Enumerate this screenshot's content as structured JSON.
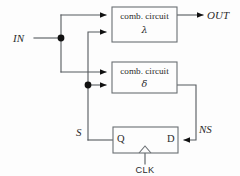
{
  "diagram": {
    "background_color": "#fdfdfd",
    "wire_color": "#555a5e",
    "box_stroke_color": "#6a6f73",
    "text_color": "#2b2b2b",
    "junction_color": "#111111"
  },
  "blocks": [
    {
      "id": "lambda-block",
      "line1": "comb. circuit",
      "line2": "λ",
      "x": 112,
      "y": 7,
      "w": 65,
      "h": 35
    },
    {
      "id": "delta-block",
      "line1": "comb. circuit",
      "line2": "δ",
      "x": 112,
      "y": 62,
      "w": 65,
      "h": 31
    },
    {
      "id": "flipflop-block",
      "pin_left": "Q",
      "pin_right": "D",
      "x": 113,
      "y": 127,
      "w": 65,
      "h": 26
    }
  ],
  "signals": {
    "input": "IN",
    "output": "OUT",
    "state": "S",
    "next_state": "NS",
    "clock": "CLK"
  },
  "pins": {
    "q": "Q",
    "d": "D"
  },
  "junctions": [
    {
      "name": "in-branch-node",
      "x": 61,
      "y": 38
    },
    {
      "name": "state-branch-node",
      "x": 88,
      "y": 85
    }
  ],
  "icons": {
    "arrow": "arrow-head-icon",
    "junction": "junction-dot-icon",
    "clock_edge": "clock-edge-triangle-icon"
  }
}
